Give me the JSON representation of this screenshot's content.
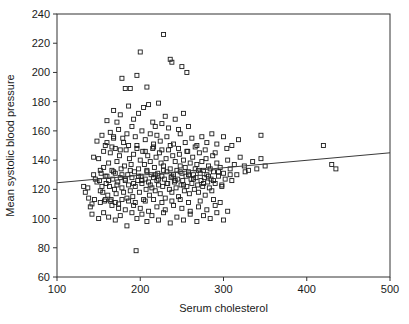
{
  "chart_data": {
    "type": "scatter",
    "title": "",
    "xlabel": "Serum cholesterol",
    "ylabel": "Mean systolic blood pressure",
    "xlim": [
      100,
      500
    ],
    "ylim": [
      60,
      240
    ],
    "xticks": [
      100,
      200,
      300,
      400,
      500
    ],
    "yticks": [
      60,
      80,
      100,
      120,
      140,
      160,
      180,
      200,
      220,
      240
    ],
    "xtick_labels": [
      "100",
      "200",
      "300",
      "400",
      "500"
    ],
    "ytick_labels": [
      "60",
      "80",
      "100",
      "120",
      "140",
      "160",
      "180",
      "200",
      "220",
      "240"
    ],
    "grid": false,
    "legend": null,
    "marker": {
      "shape": "open-square",
      "size": 4,
      "color": "#1c1c1c",
      "fill": "none"
    },
    "fit_line": {
      "type": "linear-regression",
      "x_start": 100,
      "y_start": 124.5,
      "x_end": 500,
      "y_end": 145.0,
      "color": "#3a3a3a"
    },
    "n_points": 340,
    "points": [
      [
        132,
        122
      ],
      [
        137,
        121
      ],
      [
        140,
        108
      ],
      [
        142,
        110
      ],
      [
        144,
        142
      ],
      [
        146,
        127
      ],
      [
        150,
        141
      ],
      [
        151,
        126
      ],
      [
        152,
        119
      ],
      [
        153,
        131
      ],
      [
        155,
        118
      ],
      [
        156,
        135
      ],
      [
        157,
        112
      ],
      [
        158,
        129
      ],
      [
        159,
        124
      ],
      [
        160,
        152
      ],
      [
        161,
        116
      ],
      [
        162,
        138
      ],
      [
        163,
        122
      ],
      [
        164,
        145
      ],
      [
        165,
        113
      ],
      [
        166,
        133
      ],
      [
        167,
        127
      ],
      [
        168,
        156
      ],
      [
        169,
        120
      ],
      [
        170,
        148
      ],
      [
        170,
        131
      ],
      [
        171,
        117
      ],
      [
        172,
        139
      ],
      [
        173,
        125
      ],
      [
        174,
        110
      ],
      [
        175,
        143
      ],
      [
        176,
        128
      ],
      [
        177,
        134
      ],
      [
        178,
        121
      ],
      [
        179,
        155
      ],
      [
        180,
        118
      ],
      [
        181,
        136
      ],
      [
        182,
        126
      ],
      [
        183,
        147
      ],
      [
        184,
        114
      ],
      [
        185,
        130
      ],
      [
        186,
        123
      ],
      [
        187,
        141
      ],
      [
        188,
        119
      ],
      [
        189,
        137
      ],
      [
        190,
        128
      ],
      [
        191,
        115
      ],
      [
        192,
        144
      ],
      [
        193,
        132
      ],
      [
        194,
        122
      ],
      [
        195,
        78
      ],
      [
        196,
        150
      ],
      [
        197,
        126
      ],
      [
        198,
        134
      ],
      [
        199,
        118
      ],
      [
        200,
        140
      ],
      [
        201,
        129
      ],
      [
        202,
        124
      ],
      [
        203,
        146
      ],
      [
        204,
        113
      ],
      [
        205,
        137
      ],
      [
        206,
        127
      ],
      [
        207,
        120
      ],
      [
        208,
        133
      ],
      [
        209,
        143
      ],
      [
        210,
        125
      ],
      [
        211,
        116
      ],
      [
        212,
        139
      ],
      [
        213,
        130
      ],
      [
        214,
        121
      ],
      [
        215,
        148
      ],
      [
        216,
        128
      ],
      [
        217,
        135
      ],
      [
        218,
        119
      ],
      [
        219,
        142
      ],
      [
        220,
        126
      ],
      [
        221,
        131
      ],
      [
        222,
        123
      ],
      [
        223,
        145
      ],
      [
        224,
        117
      ],
      [
        225,
        138
      ],
      [
        226,
        129
      ],
      [
        227,
        122
      ],
      [
        228,
        136
      ],
      [
        229,
        127
      ],
      [
        230,
        114
      ],
      [
        231,
        141
      ],
      [
        232,
        132
      ],
      [
        233,
        124
      ],
      [
        234,
        147
      ],
      [
        235,
        120
      ],
      [
        236,
        134
      ],
      [
        237,
        128
      ],
      [
        238,
        118
      ],
      [
        239,
        143
      ],
      [
        240,
        130
      ],
      [
        241,
        125
      ],
      [
        242,
        139
      ],
      [
        243,
        121
      ],
      [
        244,
        133
      ],
      [
        245,
        127
      ],
      [
        246,
        115
      ],
      [
        247,
        144
      ],
      [
        248,
        136
      ],
      [
        249,
        123
      ],
      [
        250,
        131
      ],
      [
        251,
        126
      ],
      [
        252,
        140
      ],
      [
        253,
        119
      ],
      [
        254,
        135
      ],
      [
        255,
        129
      ],
      [
        256,
        122
      ],
      [
        257,
        146
      ],
      [
        258,
        132
      ],
      [
        259,
        117
      ],
      [
        260,
        138
      ],
      [
        261,
        127
      ],
      [
        262,
        124
      ],
      [
        263,
        142
      ],
      [
        264,
        130
      ],
      [
        265,
        120
      ],
      [
        266,
        134
      ],
      [
        267,
        128
      ],
      [
        268,
        137
      ],
      [
        269,
        123
      ],
      [
        270,
        118
      ],
      [
        271,
        145
      ],
      [
        272,
        131
      ],
      [
        273,
        126
      ],
      [
        274,
        139
      ],
      [
        275,
        122
      ],
      [
        276,
        133
      ],
      [
        277,
        128
      ],
      [
        278,
        116
      ],
      [
        279,
        141
      ],
      [
        280,
        130
      ],
      [
        281,
        125
      ],
      [
        282,
        136
      ],
      [
        283,
        121
      ],
      [
        284,
        134
      ],
      [
        285,
        127
      ],
      [
        286,
        119
      ],
      [
        287,
        143
      ],
      [
        288,
        132
      ],
      [
        290,
        124
      ],
      [
        292,
        138
      ],
      [
        294,
        129
      ],
      [
        296,
        135
      ],
      [
        298,
        122
      ],
      [
        300,
        131
      ],
      [
        302,
        127
      ],
      [
        305,
        140
      ],
      [
        308,
        134
      ],
      [
        310,
        126
      ],
      [
        313,
        137
      ],
      [
        316,
        130
      ],
      [
        320,
        142
      ],
      [
        325,
        136
      ],
      [
        330,
        133
      ],
      [
        335,
        139
      ],
      [
        340,
        134
      ],
      [
        345,
        141
      ],
      [
        350,
        136
      ],
      [
        420,
        150
      ],
      [
        430,
        137
      ],
      [
        435,
        134
      ],
      [
        168,
        174
      ],
      [
        178,
        196
      ],
      [
        182,
        189
      ],
      [
        188,
        189
      ],
      [
        196,
        198
      ],
      [
        200,
        214
      ],
      [
        208,
        190
      ],
      [
        228,
        226
      ],
      [
        236,
        209
      ],
      [
        238,
        207
      ],
      [
        250,
        204
      ],
      [
        256,
        200
      ],
      [
        160,
        167
      ],
      [
        172,
        166
      ],
      [
        176,
        171
      ],
      [
        186,
        177
      ],
      [
        192,
        168
      ],
      [
        198,
        172
      ],
      [
        204,
        176
      ],
      [
        210,
        178
      ],
      [
        215,
        166
      ],
      [
        218,
        163
      ],
      [
        222,
        179
      ],
      [
        226,
        165
      ],
      [
        230,
        170
      ],
      [
        234,
        162
      ],
      [
        242,
        168
      ],
      [
        246,
        161
      ],
      [
        252,
        172
      ],
      [
        258,
        163
      ],
      [
        148,
        153
      ],
      [
        154,
        157
      ],
      [
        158,
        150
      ],
      [
        164,
        159
      ],
      [
        168,
        155
      ],
      [
        174,
        161
      ],
      [
        180,
        152
      ],
      [
        184,
        158
      ],
      [
        190,
        163
      ],
      [
        194,
        156
      ],
      [
        202,
        160
      ],
      [
        206,
        154
      ],
      [
        212,
        158
      ],
      [
        216,
        151
      ],
      [
        220,
        157
      ],
      [
        224,
        153
      ],
      [
        232,
        156
      ],
      [
        240,
        151
      ],
      [
        248,
        158
      ],
      [
        254,
        152
      ],
      [
        262,
        155
      ],
      [
        268,
        150
      ],
      [
        274,
        156
      ],
      [
        280,
        152
      ],
      [
        286,
        158
      ],
      [
        292,
        151
      ],
      [
        300,
        156
      ],
      [
        310,
        150
      ],
      [
        318,
        154
      ],
      [
        345,
        157
      ],
      [
        142,
        103
      ],
      [
        150,
        100
      ],
      [
        156,
        104
      ],
      [
        162,
        101
      ],
      [
        170,
        99
      ],
      [
        176,
        102
      ],
      [
        184,
        95
      ],
      [
        190,
        104
      ],
      [
        196,
        100
      ],
      [
        202,
        103
      ],
      [
        208,
        98
      ],
      [
        214,
        102
      ],
      [
        222,
        99
      ],
      [
        228,
        104
      ],
      [
        236,
        97
      ],
      [
        244,
        101
      ],
      [
        252,
        99
      ],
      [
        260,
        103
      ],
      [
        268,
        98
      ],
      [
        276,
        102
      ],
      [
        284,
        100
      ],
      [
        292,
        104
      ],
      [
        300,
        99
      ],
      [
        166,
        109
      ],
      [
        174,
        107
      ],
      [
        182,
        106
      ],
      [
        192,
        109
      ],
      [
        200,
        107
      ],
      [
        210,
        105
      ],
      [
        220,
        108
      ],
      [
        230,
        106
      ],
      [
        240,
        109
      ],
      [
        250,
        107
      ],
      [
        260,
        105
      ],
      [
        270,
        108
      ],
      [
        280,
        106
      ],
      [
        290,
        109
      ],
      [
        305,
        105
      ],
      [
        134,
        118
      ],
      [
        138,
        114
      ],
      [
        145,
        113
      ],
      [
        152,
        111
      ],
      [
        158,
        113
      ],
      [
        164,
        112
      ],
      [
        170,
        111
      ],
      [
        178,
        113
      ],
      [
        186,
        112
      ],
      [
        194,
        111
      ],
      [
        206,
        112
      ],
      [
        216,
        113
      ],
      [
        226,
        111
      ],
      [
        238,
        112
      ],
      [
        248,
        113
      ],
      [
        258,
        111
      ],
      [
        272,
        112
      ],
      [
        288,
        113
      ],
      [
        296,
        111
      ],
      [
        156,
        146
      ],
      [
        166,
        149
      ],
      [
        176,
        147
      ],
      [
        186,
        150
      ],
      [
        196,
        148
      ],
      [
        206,
        146
      ],
      [
        216,
        149
      ],
      [
        226,
        147
      ],
      [
        236,
        150
      ],
      [
        246,
        148
      ],
      [
        256,
        146
      ],
      [
        266,
        149
      ],
      [
        278,
        147
      ],
      [
        290,
        145
      ],
      [
        304,
        148
      ],
      [
        148,
        125
      ],
      [
        154,
        122
      ],
      [
        162,
        126
      ],
      [
        172,
        123
      ],
      [
        182,
        127
      ],
      [
        192,
        124
      ],
      [
        202,
        126
      ],
      [
        212,
        123
      ],
      [
        222,
        127
      ],
      [
        232,
        124
      ],
      [
        242,
        126
      ],
      [
        252,
        123
      ],
      [
        264,
        127
      ],
      [
        276,
        124
      ],
      [
        288,
        126
      ],
      [
        298,
        123
      ],
      [
        144,
        130
      ],
      [
        152,
        133
      ],
      [
        160,
        129
      ],
      [
        168,
        132
      ],
      [
        178,
        130
      ],
      [
        188,
        133
      ],
      [
        198,
        129
      ],
      [
        208,
        132
      ],
      [
        218,
        130
      ],
      [
        228,
        133
      ],
      [
        238,
        129
      ],
      [
        248,
        132
      ],
      [
        258,
        130
      ],
      [
        270,
        133
      ],
      [
        282,
        129
      ],
      [
        294,
        132
      ],
      [
        308,
        130
      ],
      [
        326,
        132
      ]
    ]
  }
}
